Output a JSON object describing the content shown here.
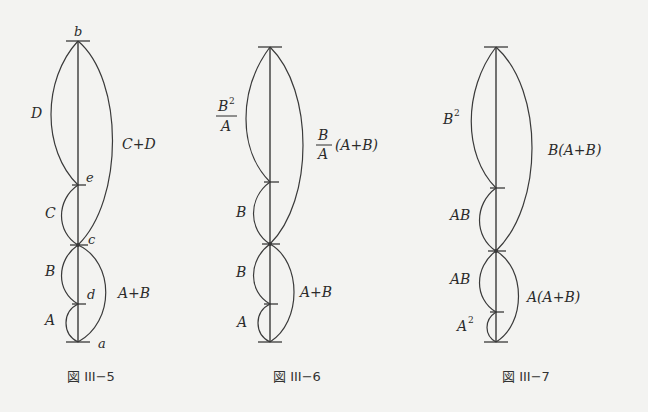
{
  "figures": [
    {
      "id": "fig-III-5",
      "caption": "図 III−5",
      "nodes": {
        "b": "b",
        "e": "e",
        "c": "c",
        "d": "d",
        "a": "a"
      },
      "left_labels": {
        "top": "D",
        "upper_mid": "C",
        "lower_mid": "B",
        "bottom": "A"
      },
      "right_labels": {
        "upper": "C+D",
        "lower": "A+B"
      }
    },
    {
      "id": "fig-III-6",
      "caption": "図 III−6",
      "left_labels": {
        "top_num": "B",
        "top_sup": "2",
        "top_den": "A",
        "upper_mid": "B",
        "lower_mid": "B",
        "bottom": "A"
      },
      "right_labels": {
        "upper_num": "B",
        "upper_den": "A",
        "upper_tail": "(A+B)",
        "lower": "A+B"
      }
    },
    {
      "id": "fig-III-7",
      "caption": "図 III−7",
      "left_labels": {
        "top_base": "B",
        "top_sup": "2",
        "upper_mid": "AB",
        "lower_mid": "AB",
        "bottom_base": "A",
        "bottom_sup": "2"
      },
      "right_labels": {
        "upper": "B(A+B)",
        "lower": "A(A+B)"
      }
    }
  ]
}
